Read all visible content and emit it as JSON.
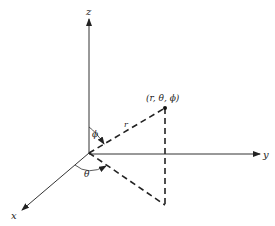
{
  "diagram": {
    "type": "spherical-coordinates",
    "axes": {
      "x_label": "x",
      "y_label": "y",
      "z_label": "z"
    },
    "point_label": "(r, θ, ϕ)",
    "radius_label": "r",
    "polar_angle_label": "ϕ",
    "azimuth_angle_label": "θ",
    "colors": {
      "line": "#222222",
      "background": "#ffffff"
    }
  }
}
